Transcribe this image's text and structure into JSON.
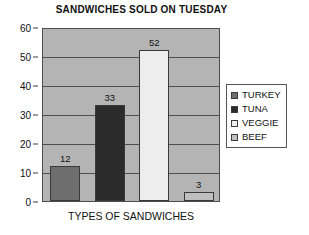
{
  "chart_data": {
    "type": "bar",
    "title": "SANDWICHES SOLD ON TUESDAY",
    "xlabel": "TYPES OF SANDWICHES",
    "ylabel": "",
    "categories": [
      "TURKEY",
      "TUNA",
      "VEGGIE",
      "BEEF"
    ],
    "values": [
      12,
      33,
      52,
      3
    ],
    "value_labels": [
      "12",
      "33",
      "52",
      "3"
    ],
    "ylim": [
      0,
      60
    ],
    "yticks": [
      0,
      10,
      20,
      30,
      40,
      50,
      60
    ],
    "ytick_labels": [
      "0",
      "10",
      "20",
      "30",
      "40",
      "50",
      "60"
    ],
    "grid": true,
    "grid_axis": "y",
    "legend_position": "right",
    "series": [
      {
        "name": "TURKEY",
        "value": 12,
        "color": "#6e6e6e"
      },
      {
        "name": "TUNA",
        "value": 33,
        "color": "#2b2b2b"
      },
      {
        "name": "VEGGIE",
        "value": 52,
        "color": "#ededed"
      },
      {
        "name": "BEEF",
        "value": 3,
        "color": "#bfbfbf"
      }
    ],
    "plot_background": "#b4b4b4",
    "page_background": "#ffffff"
  },
  "legend": {
    "items": [
      {
        "label": "TURKEY",
        "color": "#6e6e6e"
      },
      {
        "label": "TUNA",
        "color": "#2b2b2b"
      },
      {
        "label": "VEGGIE",
        "color": "#ededed"
      },
      {
        "label": "BEEF",
        "color": "#bfbfbf"
      }
    ]
  }
}
